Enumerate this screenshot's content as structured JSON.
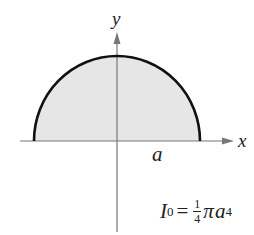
{
  "figure": {
    "type": "semicircular region diagram",
    "axes": {
      "x_label": "x",
      "y_label": "y"
    },
    "region": {
      "shape": "upper semicircle",
      "fill": "#e6e6e6",
      "stroke": "#111111"
    },
    "radius_label": "a",
    "formula": {
      "lhs": "I",
      "lhs_sub": "0",
      "equals": "=",
      "frac_num": "1",
      "frac_den": "4",
      "pi": "π",
      "var": "a",
      "exp": "4"
    }
  }
}
